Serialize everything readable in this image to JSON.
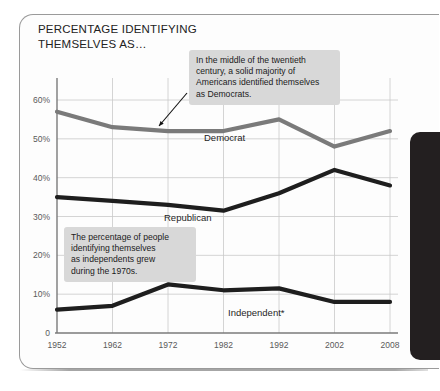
{
  "slide": {
    "title": "PERCENTAGE IDENTIFYING\nTHEMSELVES AS…"
  },
  "panel": {
    "name": "right-edge-panel",
    "color": "#231f20"
  },
  "annotations": [
    {
      "id": "democrat-note",
      "text": "In the middle of the twentieth\ncentury, a solid majority of\nAmericans identified themselves\nas Democrats.",
      "points_to": "Democrat line at 1972"
    },
    {
      "id": "independent-note",
      "text": "The percentage of people\nidentifying themselves\nas independents grew\nduring the 1970s.",
      "points_to": "Independent line at 1972"
    }
  ],
  "chart_data": {
    "type": "line",
    "title": "PERCENTAGE IDENTIFYING THEMSELVES AS…",
    "xlabel": "",
    "ylabel": "",
    "x": [
      1952,
      1962,
      1972,
      1982,
      1992,
      2002,
      2008
    ],
    "categories": [
      "1952",
      "1962",
      "1972",
      "1982",
      "1992",
      "2002",
      "2008"
    ],
    "ytick_labels": [
      "0",
      "10%",
      "20%",
      "30%",
      "40%",
      "50%",
      "60%"
    ],
    "ytick_values": [
      0,
      10,
      20,
      30,
      40,
      50,
      60
    ],
    "ylim": [
      0,
      65
    ],
    "grid": true,
    "legend": "inline-labels",
    "series": [
      {
        "name": "Democrat",
        "color": "#7a7a7a",
        "values": [
          57,
          53,
          52,
          52,
          55,
          48,
          52
        ]
      },
      {
        "name": "Republican",
        "color": "#1e1e1e",
        "values": [
          35,
          34,
          33,
          31.5,
          36,
          42,
          38
        ]
      },
      {
        "name": "Independent*",
        "color": "#1e1e1e",
        "values": [
          6,
          7,
          12.5,
          11,
          11.5,
          8,
          8
        ]
      }
    ]
  },
  "series_labels": {
    "democrat": "Democrat",
    "republican": "Republican",
    "independent": "Independent*"
  }
}
